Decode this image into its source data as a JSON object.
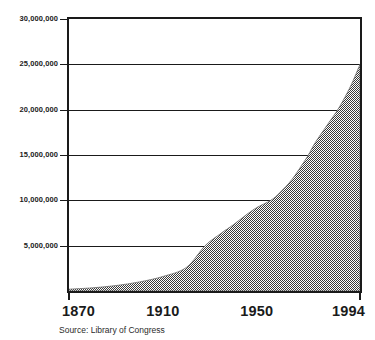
{
  "chart_data": {
    "type": "area",
    "title": "",
    "xlabel": "",
    "ylabel": "",
    "xlim": [
      1870,
      1994
    ],
    "ylim": [
      0,
      30000000
    ],
    "grid": true,
    "legend": null,
    "source": "Source:  Library of Congress",
    "fill_style": "50% black/white checkerboard dither (appears gray)",
    "y_ticks": [
      {
        "value": 30000000,
        "label": "30,000,000"
      },
      {
        "value": 25000000,
        "label": "25,000,000"
      },
      {
        "value": 20000000,
        "label": "20,000,000"
      },
      {
        "value": 15000000,
        "label": "15,000,000"
      },
      {
        "value": 10000000,
        "label": "10,000,000"
      },
      {
        "value": 5000000,
        "label": "5,000,000"
      }
    ],
    "x_ticks": [
      {
        "value": 1870,
        "label": "1870"
      },
      {
        "value": 1910,
        "label": "1910"
      },
      {
        "value": 1950,
        "label": "1950"
      },
      {
        "value": 1994,
        "label": "1994"
      }
    ],
    "x": [
      1870,
      1880,
      1890,
      1900,
      1910,
      1920,
      1928,
      1935,
      1940,
      1945,
      1950,
      1956,
      1960,
      1965,
      1970,
      1972,
      1975,
      1980,
      1985,
      1990,
      1994
    ],
    "values": [
      200000,
      350000,
      600000,
      1000000,
      1600000,
      2600000,
      5000000,
      6400000,
      7300000,
      8300000,
      9200000,
      10000000,
      10900000,
      12300000,
      14200000,
      15000000,
      16400000,
      18300000,
      20200000,
      22600000,
      25000000
    ],
    "series": [
      {
        "name": "Collection size",
        "values": [
          200000,
          350000,
          600000,
          1000000,
          1600000,
          2600000,
          5000000,
          6400000,
          7300000,
          8300000,
          9200000,
          10000000,
          10900000,
          12300000,
          14200000,
          15000000,
          16400000,
          18300000,
          20200000,
          22600000,
          25000000
        ]
      }
    ],
    "colors": {
      "axis": "#1a1a1a",
      "grid": "#1a1a1a",
      "fill": "#9a9a9a",
      "background": "#ffffff"
    }
  }
}
